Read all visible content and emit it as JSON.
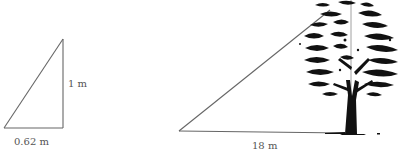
{
  "diagram": {
    "small_triangle": {
      "height_label": "1 m",
      "base_label": "0.62 m"
    },
    "large_triangle": {
      "base_label": "18 m"
    },
    "object": "tree",
    "colors": {
      "line": "#666666",
      "tree": "#111111",
      "text": "#555555"
    }
  }
}
